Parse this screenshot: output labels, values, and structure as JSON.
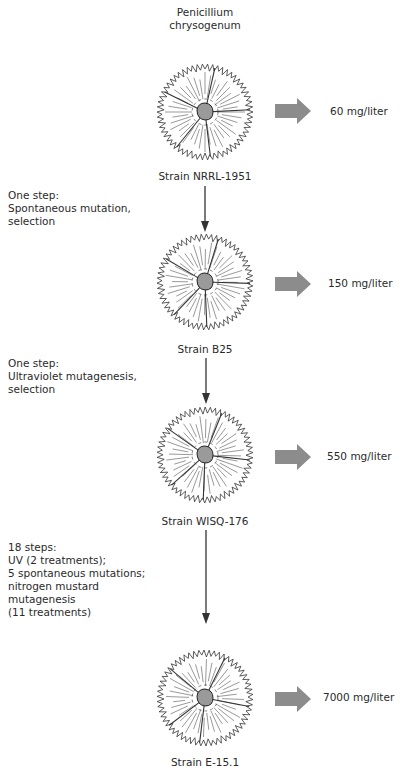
{
  "diagram": {
    "title_lines": [
      "Penicillium",
      "chrysogenum"
    ],
    "colors": {
      "text": "#2a2a2a",
      "yield_arrow": "#8c8c8c",
      "colony_outline": "#333333",
      "colony_center": "#9a9a9a",
      "step_arrow": "#333333"
    },
    "strains": [
      {
        "name": "Strain NRRL-1951",
        "yield": "60 mg/liter"
      },
      {
        "name": "Strain B25",
        "yield": "150 mg/liter"
      },
      {
        "name": "Strain WISQ-176",
        "yield": "550 mg/liter"
      },
      {
        "name": "Strain E-15.1",
        "yield": "7000 mg/liter"
      }
    ],
    "steps": [
      {
        "text": "One step:\nSpontaneous mutation,\nselection"
      },
      {
        "text": "One step:\nUltraviolet mutagenesis,\nselection"
      },
      {
        "text": "18 steps:\nUV (2 treatments);\n5 spontaneous mutations;\nnitrogen mustard\nmutagenesis\n(11 treatments)"
      }
    ]
  }
}
